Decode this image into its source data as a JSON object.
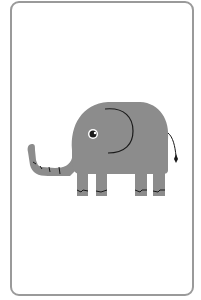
{
  "card": {
    "subject": "elephant",
    "colors": {
      "border": "#9a9a9a",
      "body": "#8c8c8c",
      "lines": "#1a1a1a",
      "background": "#ffffff"
    }
  }
}
